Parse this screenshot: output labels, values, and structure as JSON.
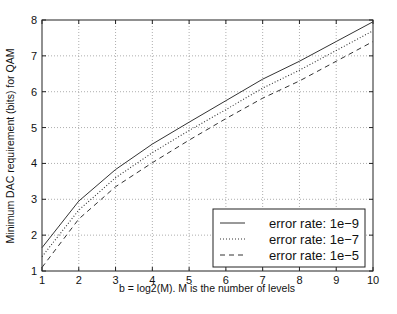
{
  "chart_data": {
    "type": "line",
    "title": "",
    "xlabel": "b = log2(M). M is the number of levels",
    "ylabel": "Minimum DAC requirement (bits) for QAM",
    "xlim": [
      1,
      10
    ],
    "ylim": [
      1,
      8
    ],
    "xticks": [
      1,
      2,
      3,
      4,
      5,
      6,
      7,
      8,
      9,
      10
    ],
    "yticks": [
      1,
      2,
      3,
      4,
      5,
      6,
      7,
      8
    ],
    "grid": true,
    "legend_position": "lower right",
    "x": [
      1,
      2,
      3,
      4,
      5,
      6,
      7,
      8,
      9,
      10
    ],
    "series": [
      {
        "name": "error rate: 1e-9",
        "style": "solid",
        "values": [
          1.65,
          2.95,
          3.83,
          4.54,
          5.15,
          5.75,
          6.35,
          6.85,
          7.4,
          7.95
        ]
      },
      {
        "name": "error rate: 1e-7",
        "style": "dotted",
        "values": [
          1.4,
          2.7,
          3.6,
          4.3,
          4.92,
          5.5,
          6.1,
          6.6,
          7.15,
          7.7
        ]
      },
      {
        "name": "error rate: 1e-5",
        "style": "dashed",
        "values": [
          1.1,
          2.45,
          3.35,
          4.02,
          4.65,
          5.25,
          5.82,
          6.3,
          6.85,
          7.4
        ]
      }
    ]
  }
}
